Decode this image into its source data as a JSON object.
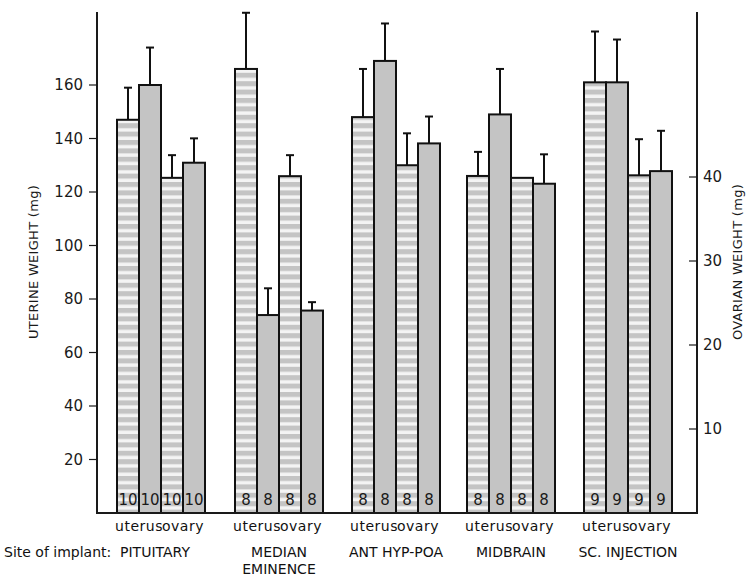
{
  "chart_data": {
    "type": "bar",
    "title": "",
    "xlabel": "Site of implant:",
    "ylabel": "UTERINE WEIGHT (mg)",
    "ylabel_right": "OVARIAN WEIGHT (mg)",
    "ylim": [
      0,
      180
    ],
    "ylim_right": [
      0,
      54
    ],
    "yticks_left": [
      20,
      40,
      60,
      80,
      100,
      120,
      140,
      160
    ],
    "yticks_right": [
      10,
      20,
      30,
      40
    ],
    "grid": false,
    "legend": null,
    "bar_labels": [
      "uterus",
      "ovary"
    ],
    "categories": [
      "PITUITARY",
      "MEDIAN EMINENCE",
      "ANT HYP-POA",
      "MIDBRAIN",
      "SC. INJECTION"
    ],
    "category_lines": [
      [
        "PITUITARY"
      ],
      [
        "MEDIAN",
        "EMINENCE"
      ],
      [
        "ANT HYP-POA"
      ],
      [
        "MIDBRAIN"
      ],
      [
        "SC. INJECTION"
      ]
    ],
    "series": [
      {
        "name": "uterus (striped)",
        "measure": "uterine weight",
        "axis": "left",
        "pattern": "striped",
        "values": [
          147,
          166,
          148,
          126,
          161
        ],
        "error_upper": [
          159,
          187,
          166,
          135,
          180
        ],
        "n": [
          10,
          8,
          8,
          8,
          9
        ]
      },
      {
        "name": "uterus (solid)",
        "measure": "uterine weight",
        "axis": "left",
        "pattern": "solid",
        "values": [
          160,
          74,
          169,
          149,
          161
        ],
        "error_upper": [
          174,
          84,
          183,
          166,
          177
        ],
        "n": [
          10,
          8,
          8,
          8,
          9
        ]
      },
      {
        "name": "ovary (striped)",
        "measure": "ovarian weight",
        "axis": "right",
        "pattern": "striped",
        "values": [
          39.9,
          40.1,
          41.4,
          39.9,
          40.2
        ],
        "error_upper": [
          42.6,
          42.6,
          45.2,
          37.1,
          44.5
        ],
        "n": [
          10,
          8,
          8,
          8,
          9
        ]
      },
      {
        "name": "ovary (solid)",
        "measure": "ovarian weight",
        "axis": "right",
        "pattern": "solid",
        "values": [
          41.7,
          24.1,
          44.0,
          39.2,
          40.7
        ],
        "error_upper": [
          44.6,
          25.1,
          47.2,
          42.7,
          45.5
        ],
        "n": [
          10,
          8,
          8,
          8,
          9
        ]
      }
    ],
    "n_labels": [
      [
        "10",
        "10",
        "10",
        "10"
      ],
      [
        "8",
        "8",
        "8",
        "8"
      ],
      [
        "8",
        "8",
        "8",
        "8"
      ],
      [
        "8",
        "8",
        "8",
        "8"
      ],
      [
        "9",
        "9",
        "9",
        "9"
      ]
    ]
  },
  "colors": {
    "bar_fill": "#c4c4c4",
    "stripe": "#f4f4f4",
    "ink": "#111111"
  }
}
